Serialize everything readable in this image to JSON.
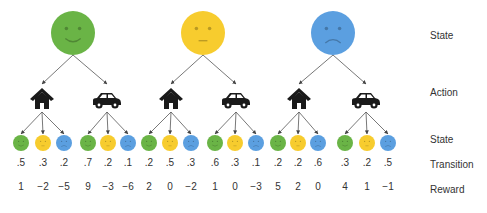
{
  "colors": {
    "green": "#6ab446",
    "yellow": "#f7cc2e",
    "blue": "#5b9fe0",
    "arrow": "#555555",
    "icon": "#1a1a1a"
  },
  "row_labels": {
    "state_top": "State",
    "action": "Action",
    "state_bottom": "State",
    "transition": "Transition",
    "reward": "Reward"
  },
  "states": [
    {
      "name": "green",
      "mood": "happy",
      "x": 73,
      "actions": [
        {
          "type": "house",
          "x": 42,
          "outcomes": [
            {
              "state": "green",
              "x": 21,
              "transition": ".5",
              "reward": "1"
            },
            {
              "state": "yellow",
              "x": 43,
              "transition": ".3",
              "reward": "−2"
            },
            {
              "state": "blue",
              "x": 64,
              "transition": ".2",
              "reward": "−5"
            }
          ]
        },
        {
          "type": "car",
          "x": 107,
          "outcomes": [
            {
              "state": "green",
              "x": 88,
              "transition": ".7",
              "reward": "9"
            },
            {
              "state": "yellow",
              "x": 108,
              "transition": ".2",
              "reward": "−3"
            },
            {
              "state": "blue",
              "x": 128,
              "transition": ".1",
              "reward": "−6"
            }
          ]
        }
      ]
    },
    {
      "name": "yellow",
      "mood": "neutral",
      "x": 203,
      "actions": [
        {
          "type": "house",
          "x": 171,
          "outcomes": [
            {
              "state": "green",
              "x": 149,
              "transition": ".2",
              "reward": "2"
            },
            {
              "state": "yellow",
              "x": 170,
              "transition": ".5",
              "reward": "0"
            },
            {
              "state": "blue",
              "x": 191,
              "transition": ".3",
              "reward": "−2"
            }
          ]
        },
        {
          "type": "car",
          "x": 236,
          "outcomes": [
            {
              "state": "green",
              "x": 215,
              "transition": ".6",
              "reward": "1"
            },
            {
              "state": "yellow",
              "x": 235,
              "transition": ".3",
              "reward": "0"
            },
            {
              "state": "blue",
              "x": 256,
              "transition": ".1",
              "reward": "−3"
            }
          ]
        }
      ]
    },
    {
      "name": "blue",
      "mood": "sad",
      "x": 333,
      "actions": [
        {
          "type": "house",
          "x": 299,
          "outcomes": [
            {
              "state": "green",
              "x": 278,
              "transition": ".2",
              "reward": "5"
            },
            {
              "state": "yellow",
              "x": 298,
              "transition": ".2",
              "reward": "2"
            },
            {
              "state": "blue",
              "x": 318,
              "transition": ".6",
              "reward": "0"
            }
          ]
        },
        {
          "type": "car",
          "x": 366,
          "outcomes": [
            {
              "state": "green",
              "x": 345,
              "transition": ".3",
              "reward": "4"
            },
            {
              "state": "yellow",
              "x": 367,
              "transition": ".2",
              "reward": "1"
            },
            {
              "state": "blue",
              "x": 388,
              "transition": ".5",
              "reward": "−1"
            }
          ]
        }
      ]
    }
  ]
}
